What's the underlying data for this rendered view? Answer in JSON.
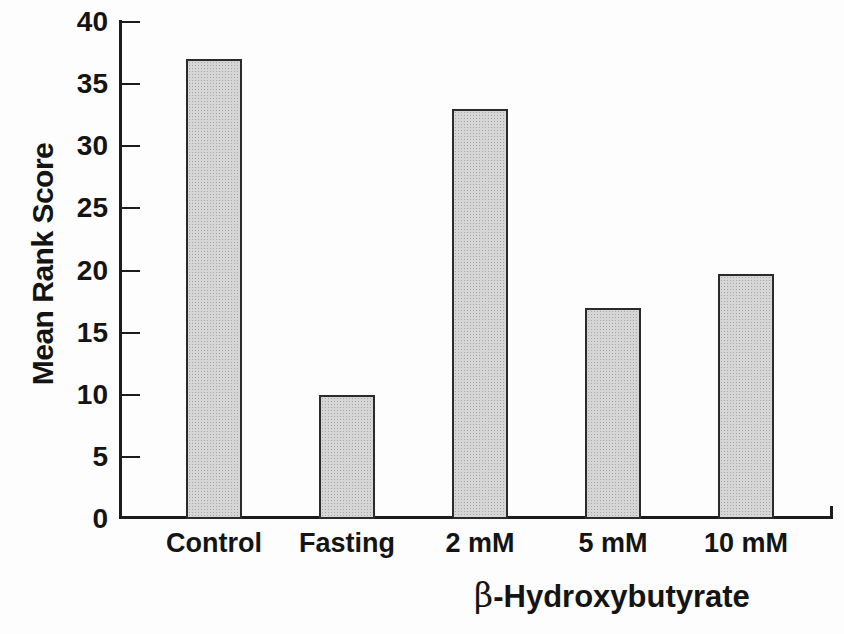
{
  "chart_data": {
    "type": "bar",
    "title": "",
    "categories": [
      "Control",
      "Fasting",
      "2 mM",
      "5 mM",
      "10 mM"
    ],
    "values": [
      37,
      10,
      33,
      17,
      19.7
    ],
    "xlabel": "β-Hydroxybutyrate",
    "xlabel_symbol": "β",
    "xlabel_rest": "-Hydroxybutyrate",
    "ylabel": "Mean Rank Score",
    "ylim": [
      0,
      40
    ],
    "yticks": [
      0,
      5,
      10,
      15,
      20,
      25,
      30,
      35,
      40
    ],
    "grid": false,
    "legend": "none",
    "colors": {
      "bar_fill": "#d6d6d6",
      "bar_stipple": "#a8a8a8",
      "bar_border": "#2b2b2b",
      "axis": "#1c1c1c",
      "text": "#141414",
      "background": "#fdfdfd"
    }
  }
}
